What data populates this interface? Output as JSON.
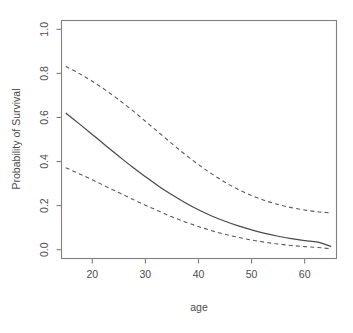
{
  "chart_data": {
    "type": "line",
    "title": "",
    "xlabel": "age",
    "ylabel": "Probability of Survival",
    "xlim": [
      14.2,
      66.0
    ],
    "ylim": [
      -0.04,
      1.04
    ],
    "xticks": [
      20,
      30,
      40,
      50,
      60
    ],
    "xtick_labels": [
      "20",
      "30",
      "40",
      "50",
      "60"
    ],
    "yticks": [
      0.0,
      0.2,
      0.4,
      0.6,
      0.8,
      1.0
    ],
    "ytick_labels": [
      "0.0",
      "0.2",
      "0.4",
      "0.6",
      "0.8",
      "1.0"
    ],
    "grid": false,
    "legend": "none",
    "box": true,
    "x": [
      15,
      17.5,
      20,
      22.5,
      25,
      27.5,
      30,
      32.5,
      35,
      37.5,
      40,
      42.5,
      45,
      47.5,
      50,
      52.5,
      55,
      57.5,
      60,
      62.5,
      65
    ],
    "series": [
      {
        "name": "upper confidence limit",
        "style": "dashed",
        "color": "#5a5a5a",
        "values": [
          0.832,
          0.8,
          0.764,
          0.724,
          0.68,
          0.633,
          0.583,
          0.532,
          0.481,
          0.432,
          0.386,
          0.344,
          0.306,
          0.273,
          0.246,
          0.223,
          0.205,
          0.191,
          0.18,
          0.172,
          0.167
        ]
      },
      {
        "name": "fitted probability",
        "style": "solid",
        "color": "#4a4a4a",
        "values": [
          0.62,
          0.572,
          0.523,
          0.473,
          0.424,
          0.376,
          0.331,
          0.288,
          0.249,
          0.213,
          0.181,
          0.153,
          0.129,
          0.108,
          0.09,
          0.074,
          0.061,
          0.05,
          0.041,
          0.034,
          0.014
        ]
      },
      {
        "name": "lower confidence limit",
        "style": "dashed",
        "color": "#5a5a5a",
        "values": [
          0.372,
          0.345,
          0.317,
          0.288,
          0.259,
          0.23,
          0.202,
          0.175,
          0.149,
          0.126,
          0.105,
          0.086,
          0.07,
          0.056,
          0.044,
          0.034,
          0.026,
          0.019,
          0.014,
          0.01,
          0.004
        ]
      }
    ]
  },
  "axes": {
    "x_title": "age",
    "y_title": "Probability of Survival"
  }
}
